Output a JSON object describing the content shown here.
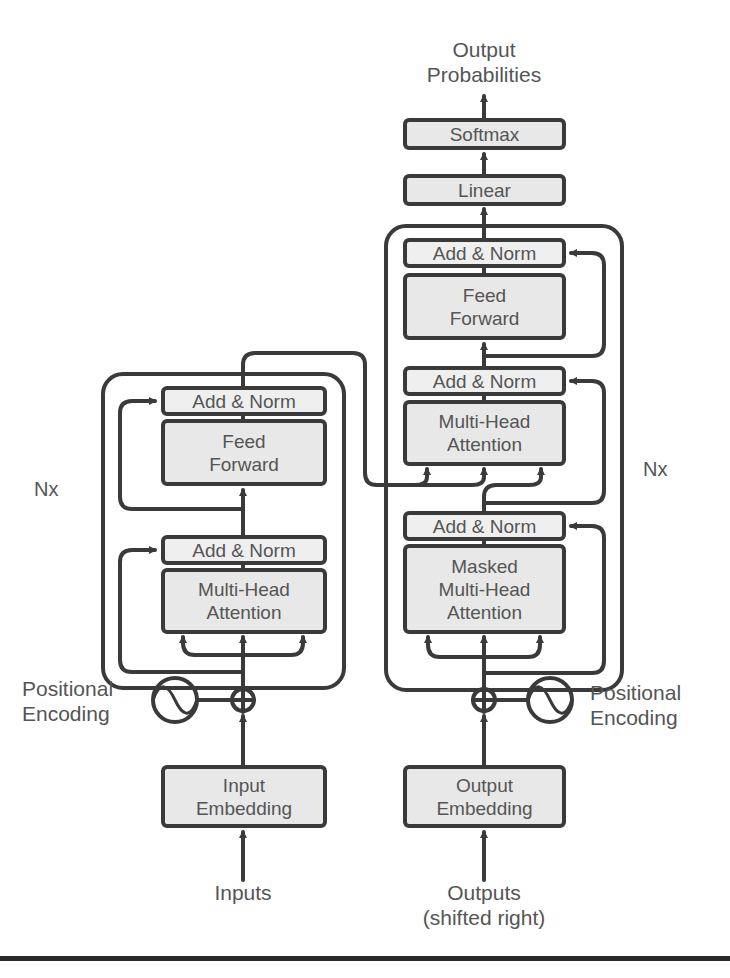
{
  "figure": {
    "colors": {
      "stroke": "#3a3a3a",
      "block_fill": "#e8e8e8",
      "norm_fill": "#efefef",
      "text": "#555555"
    }
  },
  "top": {
    "output_label_line1": "Output",
    "output_label_line2": "Probabilities",
    "softmax": "Softmax",
    "linear": "Linear"
  },
  "encoder": {
    "repeat_label": "Nx",
    "add_norm_top": "Add & Norm",
    "feed_forward_line1": "Feed",
    "feed_forward_line2": "Forward",
    "add_norm_bottom": "Add & Norm",
    "attention_line1": "Multi-Head",
    "attention_line2": "Attention",
    "positional_encoding_line1": "Positional",
    "positional_encoding_line2": "Encoding",
    "embedding_line1": "Input",
    "embedding_line2": "Embedding",
    "input_label": "Inputs"
  },
  "decoder": {
    "repeat_label": "Nx",
    "add_norm_1": "Add & Norm",
    "feed_forward_line1": "Feed",
    "feed_forward_line2": "Forward",
    "add_norm_2": "Add & Norm",
    "attention_line1": "Multi-Head",
    "attention_line2": "Attention",
    "add_norm_3": "Add & Norm",
    "masked_line1": "Masked",
    "masked_line2": "Multi-Head",
    "masked_line3": "Attention",
    "positional_encoding_line1": "Positional",
    "positional_encoding_line2": "Encoding",
    "embedding_line1": "Output",
    "embedding_line2": "Embedding",
    "output_label_line1": "Outputs",
    "output_label_line2": "(shifted right)"
  },
  "icons": {
    "add_operator": "circle-plus",
    "positional_encoding": "sine-wave-circle"
  }
}
